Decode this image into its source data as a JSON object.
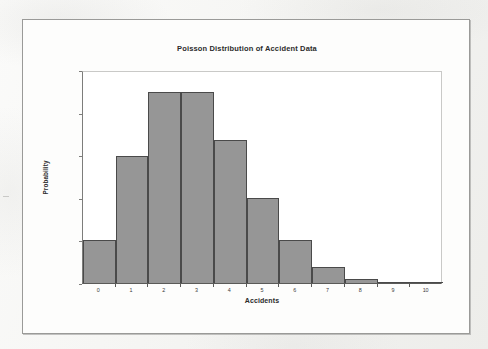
{
  "document": {
    "kind": "scanned-page",
    "background_color": "#f2f2f0",
    "page_color": "#fdfdfc",
    "border_color": "#9a9a98"
  },
  "chart_data": {
    "type": "bar",
    "title": "Poisson Distribution of Accident Data",
    "xlabel": "Accidents",
    "ylabel": "Probability",
    "categories": [
      "0",
      "1",
      "2",
      "3",
      "4",
      "5",
      "6",
      "7",
      "8",
      "9",
      "10"
    ],
    "values": [
      0.05,
      0.149,
      0.224,
      0.224,
      0.168,
      0.1,
      0.05,
      0.019,
      0.005,
      0.001,
      0.0
    ],
    "ylim": [
      0.0,
      0.25
    ],
    "y_ticks": [
      "0.000",
      "0.050",
      "0.100",
      "0.150",
      "0.200",
      "0.250"
    ],
    "y_tick_values": [
      0.0,
      0.05,
      0.1,
      0.15,
      0.2,
      0.25
    ],
    "grid": false,
    "legend": "none",
    "bar_fill_color": "#969696",
    "bar_edge_color": "#4a4a4a",
    "bar_gap": 0
  }
}
